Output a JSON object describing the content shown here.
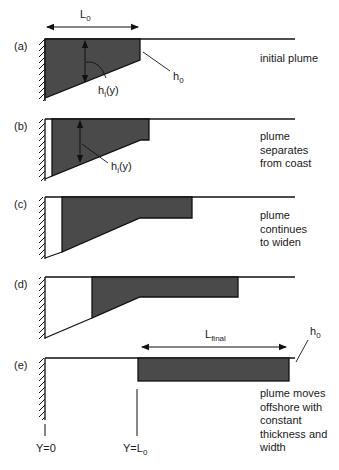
{
  "diagram": {
    "panels": [
      {
        "id": "a",
        "label": "(a)",
        "caption": [
          "initial plume"
        ]
      },
      {
        "id": "b",
        "label": "(b)",
        "caption": [
          "plume",
          "separates",
          "from coast"
        ]
      },
      {
        "id": "c",
        "label": "(c)",
        "caption": [
          "plume",
          "continues",
          "to widen"
        ]
      },
      {
        "id": "d",
        "label": "(d)",
        "caption": []
      },
      {
        "id": "e",
        "label": "(e)",
        "caption": [
          "plume moves",
          "offshore with",
          "constant",
          "thickness and",
          "width"
        ]
      }
    ],
    "symbols": {
      "L0_main": "L",
      "L0_sub": "0",
      "h0_main": "h",
      "h0_sub": "0",
      "hi_main": "h",
      "hi_sub": "i",
      "hi_arg": "(y)",
      "Lfinal_main": "L",
      "Lfinal_sub": "final"
    },
    "axis_labels": {
      "y0": "Y=0",
      "yL0_main": "Y=L",
      "yL0_sub": "0"
    },
    "colors": {
      "plume_fill": "#4a4a4a",
      "line": "#111111",
      "background": "#ffffff"
    }
  }
}
